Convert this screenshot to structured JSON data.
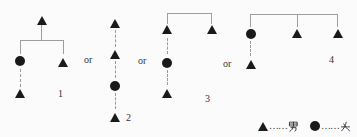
{
  "or_label": "or",
  "diagrams": [
    {
      "number": "1",
      "nodes": [
        {
          "id": "a",
          "shape": "triangle",
          "row": 0
        },
        {
          "id": "b",
          "shape": "circle",
          "row": 1
        },
        {
          "id": "c",
          "shape": "triangle",
          "row": 1
        },
        {
          "id": "d",
          "shape": "triangle",
          "row": 2
        }
      ],
      "edges": [
        {
          "from": "a",
          "to": "b",
          "style": "solid-bracket"
        },
        {
          "from": "a",
          "to": "c",
          "style": "solid-bracket"
        },
        {
          "from": "b",
          "to": "d",
          "style": "dashed"
        }
      ]
    },
    {
      "number": "2",
      "nodes": [
        {
          "id": "a",
          "shape": "triangle",
          "row": 0
        },
        {
          "id": "b",
          "shape": "triangle",
          "row": 1
        },
        {
          "id": "c",
          "shape": "circle",
          "row": 2
        },
        {
          "id": "d",
          "shape": "triangle",
          "row": 3
        }
      ],
      "edges": [
        {
          "from": "a",
          "to": "b",
          "style": "dashed"
        },
        {
          "from": "b",
          "to": "c",
          "style": "dashed"
        },
        {
          "from": "c",
          "to": "d",
          "style": "dashed"
        }
      ]
    },
    {
      "number": "3",
      "nodes": [
        {
          "id": "a",
          "shape": "triangle",
          "row": 0
        },
        {
          "id": "b",
          "shape": "triangle",
          "row": 0
        },
        {
          "id": "c",
          "shape": "circle",
          "row": 1
        },
        {
          "id": "d",
          "shape": "triangle",
          "row": 2
        }
      ],
      "edges": [
        {
          "from": "a",
          "to": "b",
          "style": "solid-bracket"
        },
        {
          "from": "a",
          "to": "c",
          "style": "dashed"
        },
        {
          "from": "c",
          "to": "d",
          "style": "dashed"
        }
      ]
    },
    {
      "number": "4",
      "nodes": [
        {
          "id": "a",
          "shape": "circle",
          "row": 0
        },
        {
          "id": "b",
          "shape": "triangle",
          "row": 0
        },
        {
          "id": "c",
          "shape": "triangle",
          "row": 0
        },
        {
          "id": "d",
          "shape": "triangle",
          "row": 1
        }
      ],
      "edges": [
        {
          "from": "a",
          "to": "b",
          "style": "solid-bracket"
        },
        {
          "from": "b",
          "to": "c",
          "style": "solid-bracket"
        },
        {
          "from": "a",
          "to": "d",
          "style": "dashed"
        }
      ]
    }
  ],
  "legend": {
    "entries": [
      {
        "symbol": "triangle",
        "leader": "……",
        "label": "男"
      },
      {
        "symbol": "circle",
        "leader": "……",
        "label": "女"
      }
    ]
  },
  "colors": {
    "symbol": "#1a1a1a",
    "line": "#9e9e9e",
    "text": "#333333",
    "background": "#fbfbfb"
  }
}
